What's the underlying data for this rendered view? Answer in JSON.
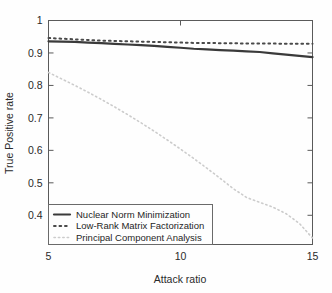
{
  "chart_data": {
    "type": "line",
    "title": "",
    "xlabel": "Attack ratio",
    "ylabel": "True Positive rate",
    "xlim": [
      5,
      15
    ],
    "ylim": [
      0.31,
      1.0
    ],
    "xticks": [
      5,
      10,
      15
    ],
    "xtick_labels": [
      "5",
      "10",
      "15"
    ],
    "yticks": [
      0.4,
      0.5,
      0.6,
      0.7,
      0.8,
      0.9,
      1.0
    ],
    "ytick_labels": [
      "0.4",
      "0.5",
      "0.6",
      "0.7",
      "0.8",
      "0.9",
      "1"
    ],
    "grid": false,
    "legend_position": "lower left",
    "x": [
      5,
      5.5,
      6,
      6.5,
      7,
      7.5,
      8,
      8.5,
      9,
      9.5,
      10,
      10.5,
      11,
      11.5,
      12,
      12.5,
      13,
      13.5,
      14,
      14.5,
      15
    ],
    "series": [
      {
        "name": "Nuclear Norm Minimization",
        "style": "solid",
        "color": "#3a3a3a",
        "width": 2.2,
        "values": [
          0.936,
          0.935,
          0.934,
          0.932,
          0.93,
          0.928,
          0.926,
          0.924,
          0.922,
          0.919,
          0.916,
          0.913,
          0.911,
          0.909,
          0.907,
          0.905,
          0.903,
          0.899,
          0.895,
          0.891,
          0.887
        ]
      },
      {
        "name": "Low-Rank Matrix Factorization",
        "style": "dotted",
        "color": "#4a4a4a",
        "width": 2.0,
        "values": [
          0.946,
          0.944,
          0.942,
          0.94,
          0.938,
          0.937,
          0.936,
          0.935,
          0.934,
          0.933,
          0.932,
          0.931,
          0.931,
          0.93,
          0.93,
          0.929,
          0.929,
          0.929,
          0.928,
          0.928,
          0.928
        ]
      },
      {
        "name": "Principal Component Analysis",
        "style": "dotted",
        "color": "#cccccc",
        "width": 1.6,
        "values": [
          0.84,
          0.82,
          0.8,
          0.779,
          0.757,
          0.734,
          0.71,
          0.685,
          0.659,
          0.632,
          0.604,
          0.575,
          0.545,
          0.514,
          0.482,
          0.455,
          0.44,
          0.425,
          0.405,
          0.375,
          0.33
        ]
      }
    ]
  },
  "axes": {
    "x_label": "Attack ratio",
    "y_label": "True Positive rate"
  },
  "legend": {
    "items": [
      {
        "label": "Nuclear Norm Minimization",
        "swatch": "solid-line-swatch"
      },
      {
        "label": "Low-Rank Matrix Factorization",
        "swatch": "dotted-line-swatch"
      },
      {
        "label": "Principal Component Analysis",
        "swatch": "light-dotted-line-swatch"
      }
    ]
  },
  "colors": {
    "nnm": "#3a3a3a",
    "lrmf": "#4a4a4a",
    "pca": "#cccccc",
    "axis": "#5a5a5a",
    "background": "#fefefe"
  }
}
